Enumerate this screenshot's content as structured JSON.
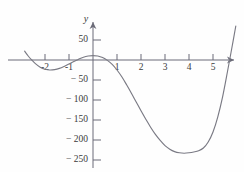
{
  "chart_data": {
    "type": "line",
    "title": "",
    "subtitle": "",
    "xlabel": "x",
    "ylabel": "y",
    "grid": false,
    "legend": null,
    "xlim": [
      -3.0,
      6.0
    ],
    "ylim": [
      -270,
      60
    ],
    "x_ticks": [
      -2,
      -1,
      1,
      2,
      3,
      4,
      5
    ],
    "x_tick_labels": [
      "-2",
      "-1",
      "1",
      "2",
      "3",
      "4",
      "5"
    ],
    "y_ticks": [
      50,
      -50,
      -100,
      -150,
      -200,
      -250
    ],
    "y_tick_labels": [
      "50",
      "− 50",
      "− 100",
      "− 150",
      "− 200",
      "− 250"
    ],
    "series": [
      {
        "name": "curve",
        "color": "#7a7a84",
        "x": [
          -2.85,
          -2.7,
          -2.55,
          -2.4,
          -2.2,
          -2.0,
          -1.8,
          -1.6,
          -1.4,
          -1.2,
          -1.0,
          -0.8,
          -0.6,
          -0.4,
          -0.2,
          0.0,
          0.2,
          0.4,
          0.6,
          0.8,
          1.0,
          1.2,
          1.4,
          1.6,
          1.8,
          2.0,
          2.2,
          2.4,
          2.6,
          2.8,
          3.0,
          3.2,
          3.4,
          3.6,
          3.8,
          4.0,
          4.2,
          4.4,
          4.6,
          4.8,
          5.0,
          5.2,
          5.4,
          5.6,
          5.8,
          5.95
        ],
        "y": [
          22,
          10,
          0,
          -9,
          -18,
          -23,
          -25,
          -24,
          -21,
          -16,
          -10,
          -4,
          2,
          7,
          10,
          11,
          10,
          6,
          -1,
          -11,
          -25,
          -42,
          -62,
          -83,
          -105,
          -127,
          -148,
          -168,
          -186,
          -201,
          -214,
          -223,
          -229,
          -232,
          -233,
          -232,
          -230,
          -227,
          -220,
          -205,
          -180,
          -142,
          -92,
          -30,
          35,
          85
        ]
      }
    ],
    "features": {
      "local_max": {
        "x": 0.0,
        "y": 11
      },
      "local_min_left": {
        "x": -1.8,
        "y": -25
      },
      "global_min": {
        "x": 3.9,
        "y": -233
      },
      "x_intercepts": [
        -2.55,
        0.55,
        5.7
      ]
    }
  },
  "axes": {
    "origin_px": {
      "x": 93,
      "y": 60
    },
    "x_unit_px": 24,
    "y_unit_px": 0.4,
    "y_axis_arrow": true,
    "x_axis_arrow": true
  }
}
